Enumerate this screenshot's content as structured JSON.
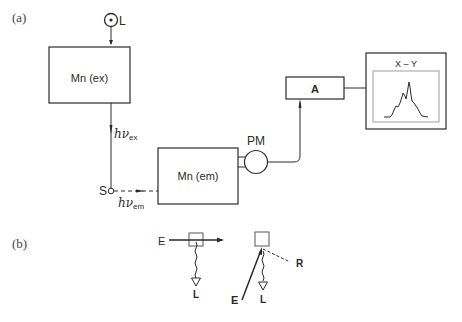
{
  "panel_a": {
    "label": "(a)",
    "light_source": "L",
    "excitation_mono": "Mn (ex)",
    "excitation_photon": "hν",
    "excitation_sub": "ex",
    "sample": "S",
    "emission_photon": "hν",
    "emission_sub": "em",
    "emission_mono": "Mn (em)",
    "photomultiplier": "PM",
    "amplifier": "A",
    "recorder": "X – Y"
  },
  "panel_b": {
    "label": "(b)",
    "left": {
      "excitation": "E",
      "luminescence": "L"
    },
    "right": {
      "excitation": "E",
      "luminescence": "L",
      "reflected": "R"
    }
  }
}
